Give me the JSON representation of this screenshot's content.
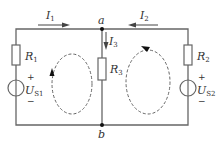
{
  "diagram": {
    "type": "circuit",
    "colors": {
      "wire": "#666666",
      "loop": "#666666",
      "text": "#333333",
      "background": "#ffffff"
    },
    "nodes": [
      {
        "id": "a",
        "label": "a"
      },
      {
        "id": "b",
        "label": "b"
      }
    ],
    "currents": [
      {
        "id": "I1",
        "main": "I",
        "sub": "1",
        "direction": "right"
      },
      {
        "id": "I2",
        "main": "I",
        "sub": "2",
        "direction": "left"
      },
      {
        "id": "I3",
        "main": "I",
        "sub": "3",
        "direction": "down"
      }
    ],
    "resistors": [
      {
        "id": "R1",
        "main": "R",
        "sub": "1"
      },
      {
        "id": "R2",
        "main": "R",
        "sub": "2"
      },
      {
        "id": "R3",
        "main": "R",
        "sub": "3"
      }
    ],
    "sources": [
      {
        "id": "US1",
        "main": "U",
        "sub": "S1",
        "plus": "+",
        "minus": "−"
      },
      {
        "id": "US2",
        "main": "U",
        "sub": "S2",
        "plus": "+",
        "minus": "−"
      }
    ],
    "loops": [
      {
        "id": "left-mesh",
        "direction": "clockwise"
      },
      {
        "id": "right-mesh",
        "direction": "counterclockwise"
      }
    ]
  }
}
